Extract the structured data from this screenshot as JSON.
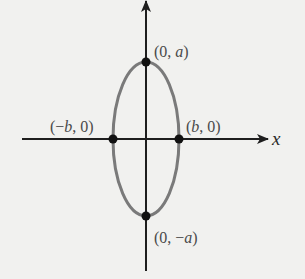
{
  "diagram": {
    "type": "ellipse-on-axes",
    "axes": {
      "x_label": "x",
      "y_label": ""
    },
    "ellipse": {
      "orientation": "vertical major axis",
      "stroke_color": "#7a7a7a"
    },
    "points": [
      {
        "id": "top",
        "label": "(0, a)",
        "label_parts": [
          "(0, ",
          "a",
          ")"
        ]
      },
      {
        "id": "bottom",
        "label": "(0, −a)",
        "label_parts": [
          "(0, −",
          "a",
          ")"
        ]
      },
      {
        "id": "left",
        "label": "(−b, 0)",
        "label_parts": [
          "(−",
          "b",
          ", 0)"
        ]
      },
      {
        "id": "right",
        "label": "(b, 0)",
        "label_parts": [
          "(",
          "b",
          ", 0)"
        ]
      }
    ],
    "colors": {
      "background": "#f1f1ef",
      "axis": "#1e1e1e",
      "point": "#111111",
      "text": "#4a4a4a"
    }
  }
}
